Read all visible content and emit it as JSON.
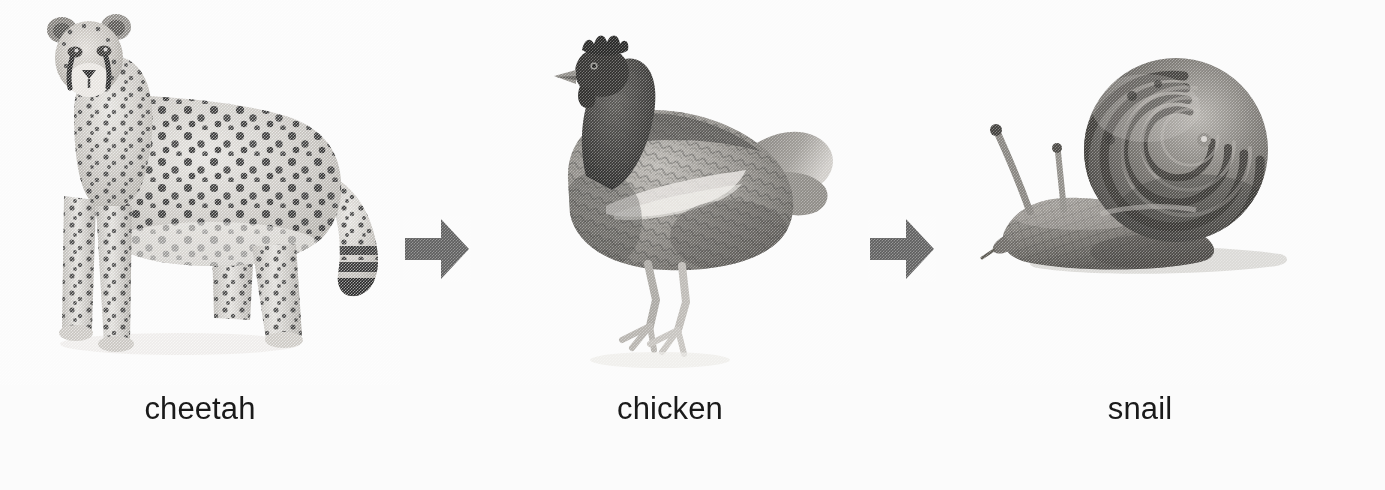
{
  "figure": {
    "type": "sequence-diagram",
    "orientation": "horizontal",
    "background_color": "#fbfbfb",
    "color_mode": "grayscale-halftone"
  },
  "sequence": {
    "items": [
      {
        "label": "cheetah",
        "icon": "cheetah-photo",
        "position": 1,
        "facing": "front-left"
      },
      {
        "label": "chicken",
        "icon": "chicken-photo",
        "position": 2,
        "facing": "left"
      },
      {
        "label": "snail",
        "icon": "snail-photo",
        "position": 3,
        "facing": "left"
      }
    ],
    "connectors": [
      {
        "icon": "arrow-right-icon",
        "between": "cheetah-to-chicken",
        "color": "#5e5e5e"
      },
      {
        "icon": "arrow-right-icon",
        "between": "chicken-to-snail",
        "color": "#5e5e5e"
      }
    ]
  },
  "colors": {
    "label_text": "#1a1a1a",
    "arrow_fill": "#5e5e5e",
    "background": "#fbfbfb",
    "fur_light": "#d8d6d2",
    "fur_mid": "#9a9792",
    "spot_dark": "#2b2b2b",
    "feather_dark": "#3a3a3a",
    "shell_mid": "#6e6b66",
    "shadow": "#c9c7c3"
  }
}
